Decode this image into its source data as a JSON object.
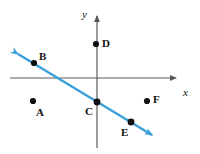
{
  "figure": {
    "type": "coordinate-plane-diagram",
    "width": 200,
    "height": 154,
    "background_color": "#ffffff"
  },
  "colors": {
    "axis": "#5a5a5a",
    "line": "#3a9fd8",
    "point": "#111111",
    "label": "#111111"
  },
  "axes": {
    "x_axis": {
      "label": "x",
      "label_x": 183,
      "label_y": 87,
      "y_pixel": 78,
      "x_start": 10,
      "x_end": 180,
      "arrow": "right"
    },
    "y_axis": {
      "label": "y",
      "label_x": 82,
      "label_y": 9,
      "x_pixel": 97,
      "y_start": 148,
      "y_end": 11,
      "arrow": "up"
    },
    "origin": {
      "x": 97,
      "y": 78
    }
  },
  "line": {
    "name": "blue-line",
    "color": "#3a9fd8",
    "stroke_width": 2.4,
    "double_arrow": true,
    "start": {
      "x": 13,
      "y": 51
    },
    "end": {
      "x": 157,
      "y": 138
    },
    "x_intercept_pixel": {
      "x": 60,
      "y": 78
    },
    "passes_through": [
      "B",
      "C",
      "E"
    ]
  },
  "points": [
    {
      "id": "A",
      "label": "A",
      "cx": 33,
      "cy": 101,
      "label_x": 36,
      "label_y": 107,
      "on_line": false
    },
    {
      "id": "B",
      "label": "B",
      "cx": 34,
      "cy": 63,
      "label_x": 39,
      "label_y": 51,
      "on_line": true
    },
    {
      "id": "C",
      "label": "C",
      "cx": 97,
      "cy": 102,
      "label_x": 85,
      "label_y": 106,
      "on_line": true
    },
    {
      "id": "D",
      "label": "D",
      "cx": 96,
      "cy": 44,
      "label_x": 102,
      "label_y": 38,
      "on_line": false
    },
    {
      "id": "E",
      "label": "E",
      "cx": 131,
      "cy": 122,
      "label_x": 121,
      "label_y": 127,
      "on_line": true
    },
    {
      "id": "F",
      "label": "F",
      "cx": 147,
      "cy": 101,
      "label_x": 153,
      "label_y": 94,
      "on_line": false
    }
  ]
}
